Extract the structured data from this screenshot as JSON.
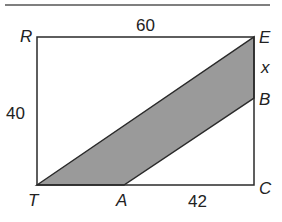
{
  "figure": {
    "colors": {
      "line": "#2a2a2a",
      "shaded_fill": "#9a9a9a",
      "rule": "#555555",
      "text": "#222222"
    },
    "rule": {
      "x1": 5,
      "y1": 5,
      "x2": 270,
      "y2": 5
    },
    "vertices": {
      "R": {
        "label": "R",
        "x": 37,
        "y": 37
      },
      "E": {
        "label": "E",
        "x": 254,
        "y": 37
      },
      "B": {
        "label": "B",
        "x": 254,
        "y": 98
      },
      "C": {
        "label": "C",
        "x": 254,
        "y": 185
      },
      "A": {
        "label": "A",
        "x": 124,
        "y": 185
      },
      "T": {
        "label": "T",
        "x": 37,
        "y": 185
      }
    },
    "measurements": {
      "RE": "60",
      "RT": "40",
      "AC": "42",
      "EB": "x"
    },
    "shaded_region": "parallelogram TEBA",
    "rectangle": "RECT"
  }
}
